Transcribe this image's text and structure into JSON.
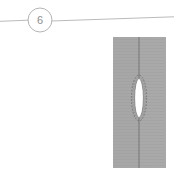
{
  "drawing": {
    "title": "Weld section detail",
    "background_color": "#ffffff",
    "detail_callout": {
      "label": "6",
      "shape": "circle",
      "center_x": 40,
      "center_y": 20,
      "radius": 12,
      "stroke_color": "#b3b3b3",
      "text_color": "#8d8d8d"
    },
    "leader_line": {
      "name": "leader-line",
      "stroke_color": "#b0b0b0",
      "left_segment": {
        "x1": 0,
        "y1": 21,
        "x2": 28,
        "y2": 20
      },
      "right_segment": {
        "x1": 52,
        "y1": 21,
        "x2": 174,
        "y2": 17
      }
    },
    "section_block": {
      "name": "hatched-section-block",
      "x": 113,
      "y": 37,
      "width": 53,
      "height": 131,
      "fill_color": "#a8a8a8",
      "hatch_color": "#9b9b9b",
      "edge_color": "#9a9a9a",
      "centerline_color": "#6f6f6f"
    },
    "defect_ellipse": {
      "name": "lens-void",
      "center_x": 139,
      "center_y": 98,
      "radius_x": 4.5,
      "radius_y": 20,
      "fill_color": "#ffffff",
      "stroke_color": "#7a7a7a",
      "halo_radius_x": 7.5,
      "halo_radius_y": 23,
      "halo_stroke_color": "#6d6d6d",
      "halo_dash": "1.5 1.5"
    }
  }
}
